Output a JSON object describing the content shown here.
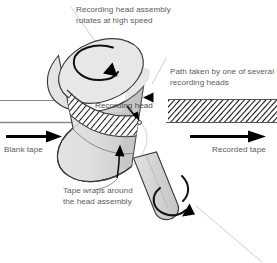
{
  "figure": {
    "background_color": "#ffffff",
    "width": 277,
    "height": 263
  },
  "labels": {
    "assembly": {
      "line1": "Recording head assembly",
      "line2": "rotates at high speed"
    },
    "path": {
      "line1": "Path taken by one of several",
      "line2": "recording heads"
    },
    "recording_head": "Recording head",
    "blank_tape": "Blank tape",
    "recorded_tape": "Recorded tape",
    "wrap": {
      "line1": "Tape wraps around",
      "line2": "the head assembly"
    }
  },
  "colors": {
    "text": "#5b5b5b",
    "outline": "#3a3a3a",
    "drum_fill": "#dcdcdc",
    "drum_top_fill": "#e4e4e4",
    "drum_shadow": "#c9c9c9",
    "shaft_fill": "#d6d6d6",
    "tape_line": "#8a8a8a",
    "hatch": "#111111",
    "arrow": "#000000",
    "leader": "#cfcfcf"
  },
  "elements": {
    "drum": "rotating-head-drum",
    "drum_top_face": "drum-top-face",
    "shaft": "drive-shaft",
    "tape_band": "helical-tape-band",
    "blank_tape_path": "blank-tape-path",
    "recorded_tape_path": "recorded-tape-path",
    "rotation_arrow_top": "drum-rotation-arrow",
    "rotation_arrow_shaft": "shaft-rotation-arrow",
    "blank_tape_arrow": "blank-tape-direction-arrow",
    "recorded_tape_arrow": "recorded-tape-direction-arrow",
    "head_marker": "recording-head-marker",
    "head_path_pointer": "head-path-pointer"
  }
}
